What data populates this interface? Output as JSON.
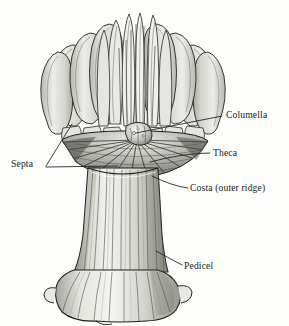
{
  "figure": {
    "background_color": "#fdfdfc",
    "ink_color": "#1b1b1b",
    "shade_light": "#efefec",
    "shade_mid": "#cfcfca",
    "shade_dark": "#8d8d88",
    "width": 289,
    "height": 326
  },
  "labels": [
    {
      "id": "columella",
      "text": "Columella",
      "align": "left",
      "leader": {
        "from_x": 222,
        "from_y": 116,
        "to_x": 136,
        "to_y": 133
      }
    },
    {
      "id": "theca",
      "text": "Theca",
      "align": "left",
      "leader": {
        "from_x": 210,
        "from_y": 153,
        "to_x": 150,
        "to_y": 162
      }
    },
    {
      "id": "costa",
      "text": "Costa (outer ridge)",
      "align": "left",
      "leader": {
        "from_x": 188,
        "from_y": 188,
        "to_x": 152,
        "to_y": 176
      }
    },
    {
      "id": "septa",
      "text": "Septa",
      "align": "right",
      "leader_a": {
        "from_x": 46,
        "from_y": 166,
        "to_x": 72,
        "to_y": 124
      },
      "leader_b": {
        "from_x": 46,
        "from_y": 167,
        "to_x": 118,
        "to_y": 166
      }
    },
    {
      "id": "pedicel",
      "text": "Pedicel",
      "align": "left",
      "leader": {
        "from_x": 182,
        "from_y": 265,
        "to_x": 156,
        "to_y": 251
      }
    }
  ],
  "anatomy_parts": [
    {
      "name": "Columella",
      "description": "central pillar at the axis of the calyx"
    },
    {
      "name": "Theca",
      "description": "outer wall of the corallite"
    },
    {
      "name": "Costa (outer ridge)",
      "description": "external ridge continuing a septum"
    },
    {
      "name": "Septa",
      "description": "radiating vertical plates inside the calyx"
    },
    {
      "name": "Pedicel",
      "description": "flared attachment base of the skeleton"
    }
  ],
  "icons": {
    "leader_line": "leader-line-icon"
  }
}
